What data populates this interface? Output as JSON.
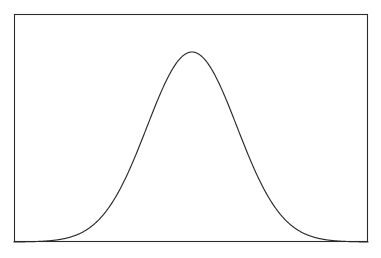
{
  "figure": {
    "name": "bell-curve-figure",
    "background_color": "#ffffff",
    "line_color": "#2b2b2b",
    "frame": {
      "x": 14,
      "y": 14,
      "width": 354,
      "height": 228,
      "stroke_width": 1.1
    },
    "canvas": {
      "width": 381,
      "height": 258
    }
  },
  "chart_data": {
    "type": "line",
    "title": "",
    "subtitle": "",
    "xlabel": "",
    "ylabel": "",
    "grid": false,
    "legend": null,
    "legend_position": "none",
    "annotations": [],
    "xticks": [],
    "yticks": [],
    "xtick_labels": [],
    "ytick_labels": [],
    "xlim": [
      -4,
      4
    ],
    "ylim": [
      0,
      0.42
    ],
    "distribution": {
      "name": "normal",
      "mean": 0,
      "std_dev": 1,
      "peak_pixel_x": 192,
      "peak_pixel_y": 52,
      "baseline_pixel_y": 242,
      "half_max_pixel_x_left": 139,
      "half_max_pixel_x_right": 245,
      "sigma_pixels": 45
    },
    "series": [
      {
        "name": "normal-pdf",
        "color": "#2b2b2b",
        "x": [
          -4,
          -3.75,
          -3.5,
          -3.25,
          -3,
          -2.75,
          -2.5,
          -2.25,
          -2,
          -1.75,
          -1.5,
          -1.25,
          -1,
          -0.75,
          -0.5,
          -0.25,
          0,
          0.25,
          0.5,
          0.75,
          1,
          1.25,
          1.5,
          1.75,
          2,
          2.25,
          2.5,
          2.75,
          3,
          3.25,
          3.5,
          3.75,
          4
        ],
        "values": [
          0.0001,
          0.0004,
          0.0009,
          0.002,
          0.0044,
          0.0091,
          0.0175,
          0.0317,
          0.054,
          0.0863,
          0.1295,
          0.1826,
          0.242,
          0.3011,
          0.3521,
          0.3867,
          0.3989,
          0.3867,
          0.3521,
          0.3011,
          0.242,
          0.1826,
          0.1295,
          0.0863,
          0.054,
          0.0317,
          0.0175,
          0.0091,
          0.0044,
          0.002,
          0.0009,
          0.0004,
          0.0001
        ]
      }
    ]
  }
}
